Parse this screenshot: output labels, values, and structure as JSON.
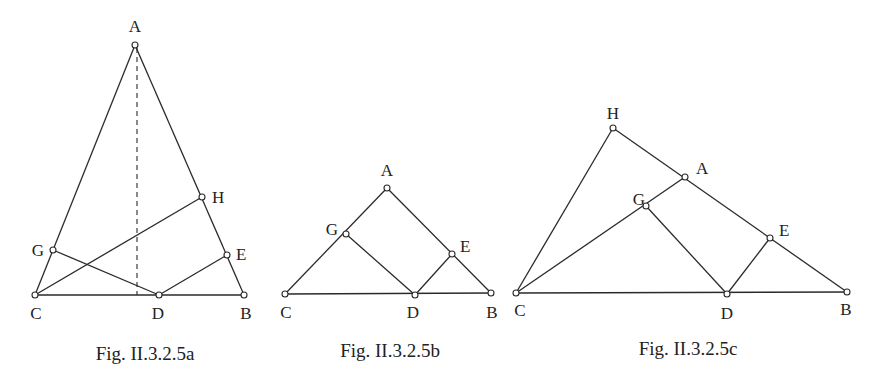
{
  "figures": [
    {
      "id": "a",
      "caption": "Fig. II.3.2.5a",
      "caption_pos": [
        145,
        360
      ],
      "points": {
        "A": {
          "x": 135,
          "y": 45,
          "label": "A",
          "lx": 135,
          "ly": 32,
          "anchor": "middle"
        },
        "H": {
          "x": 202,
          "y": 197,
          "label": "H",
          "lx": 212,
          "ly": 203,
          "anchor": "start"
        },
        "G": {
          "x": 53,
          "y": 250,
          "label": "G",
          "lx": 44,
          "ly": 256,
          "anchor": "end"
        },
        "E": {
          "x": 227,
          "y": 255,
          "label": "E",
          "lx": 236,
          "ly": 260,
          "anchor": "start"
        },
        "C": {
          "x": 35,
          "y": 295,
          "label": "C",
          "lx": 36,
          "ly": 319,
          "anchor": "middle"
        },
        "D": {
          "x": 159,
          "y": 295,
          "label": "D",
          "lx": 158,
          "ly": 319,
          "anchor": "middle"
        },
        "B": {
          "x": 244,
          "y": 295,
          "label": "B",
          "lx": 246,
          "ly": 319,
          "anchor": "middle"
        }
      },
      "segments": [
        [
          "A",
          "C"
        ],
        [
          "A",
          "B"
        ],
        [
          "C",
          "B"
        ],
        [
          "C",
          "H"
        ],
        [
          "G",
          "D"
        ],
        [
          "D",
          "E"
        ]
      ],
      "dashed": [
        [
          137,
          48,
          137,
          295
        ]
      ]
    },
    {
      "id": "b",
      "caption": "Fig. II.3.2.5b",
      "caption_pos": [
        390,
        357
      ],
      "points": {
        "A": {
          "x": 387,
          "y": 188,
          "label": "A",
          "lx": 387,
          "ly": 176,
          "anchor": "middle"
        },
        "G": {
          "x": 346,
          "y": 234,
          "label": "G",
          "lx": 338,
          "ly": 235,
          "anchor": "end"
        },
        "E": {
          "x": 452,
          "y": 254,
          "label": "E",
          "lx": 460,
          "ly": 252,
          "anchor": "start"
        },
        "C": {
          "x": 285,
          "y": 294,
          "label": "C",
          "lx": 286,
          "ly": 318,
          "anchor": "middle"
        },
        "D": {
          "x": 415,
          "y": 295,
          "label": "D",
          "lx": 413,
          "ly": 318,
          "anchor": "middle"
        },
        "B": {
          "x": 491,
          "y": 293,
          "label": "B",
          "lx": 492,
          "ly": 318,
          "anchor": "middle"
        }
      },
      "segments": [
        [
          "A",
          "C"
        ],
        [
          "A",
          "B"
        ],
        [
          "C",
          "B"
        ],
        [
          "G",
          "D"
        ],
        [
          "D",
          "E"
        ]
      ],
      "dashed": []
    },
    {
      "id": "c",
      "caption": "Fig. II.3.2.5c",
      "caption_pos": [
        688,
        355
      ],
      "points": {
        "H": {
          "x": 613,
          "y": 128,
          "label": "H",
          "lx": 613,
          "ly": 119,
          "anchor": "middle"
        },
        "A": {
          "x": 685,
          "y": 177,
          "label": "A",
          "lx": 696,
          "ly": 174,
          "anchor": "start"
        },
        "G": {
          "x": 646,
          "y": 206,
          "label": "G",
          "lx": 639,
          "ly": 205,
          "anchor": "middle"
        },
        "E": {
          "x": 770,
          "y": 238,
          "label": "E",
          "lx": 779,
          "ly": 236,
          "anchor": "start"
        },
        "C": {
          "x": 516,
          "y": 293,
          "label": "C",
          "lx": 520,
          "ly": 316,
          "anchor": "middle"
        },
        "D": {
          "x": 727,
          "y": 294,
          "label": "D",
          "lx": 727,
          "ly": 319,
          "anchor": "middle"
        },
        "B": {
          "x": 847,
          "y": 292,
          "label": "B",
          "lx": 846,
          "ly": 315,
          "anchor": "middle"
        }
      },
      "segments": [
        [
          "C",
          "H"
        ],
        [
          "H",
          "B"
        ],
        [
          "C",
          "B"
        ],
        [
          "C",
          "A"
        ],
        [
          "G",
          "D"
        ],
        [
          "D",
          "E"
        ]
      ],
      "dashed": []
    }
  ]
}
